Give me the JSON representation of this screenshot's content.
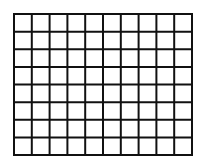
{
  "grid": {
    "columns": 10,
    "rows": 8,
    "left": 14,
    "top": 14,
    "width": 178,
    "height": 141,
    "line_color": "#111111",
    "line_width": 2,
    "background": "#ffffff"
  }
}
